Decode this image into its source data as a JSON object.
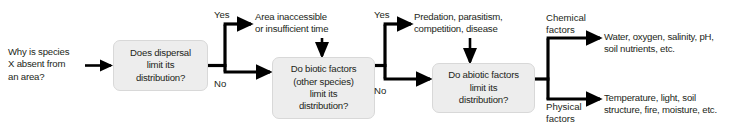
{
  "diagram": {
    "type": "flowchart",
    "title": "Why is species X absent from an area?",
    "background_color": "#ffffff",
    "node_fill_color": "#ededed",
    "node_border_color": "#d8d8d8",
    "connector_color": "#000000",
    "text_color": "#231f20"
  },
  "entry": {
    "question": "Why is species\nX absent from\nan area?"
  },
  "nodes": {
    "dispersal": {
      "text": "Does dispersal\nlimit its\ndistribution?"
    },
    "biotic": {
      "text": "Do biotic factors\n(other species)\nlimit its\ndistribution?"
    },
    "abiotic": {
      "text": "Do abiotic factors\nlimit its\ndistribution?"
    }
  },
  "branches": {
    "dispersal_yes": "Yes",
    "dispersal_no": "No",
    "biotic_yes": "Yes",
    "biotic_no": "No",
    "abiotic_chemical": "Chemical\nfactors",
    "abiotic_physical": "Physical\nfactors"
  },
  "outcomes": {
    "dispersal_yes_text": "Area inaccessible\nor insufficient time",
    "biotic_yes_text": "Predation, parasitism,\ncompetition, disease",
    "chemical_text": "Water, oxygen, salinity, pH,\nsoil nutrients, etc.",
    "physical_text": "Temperature, light, soil\nstructure, fire, moisture, etc."
  }
}
